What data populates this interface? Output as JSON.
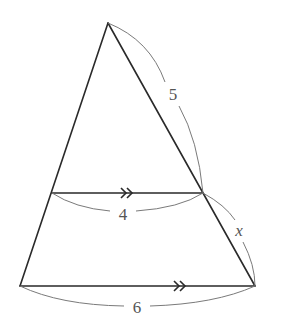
{
  "diagram": {
    "type": "similar-triangles-parallel-lines",
    "points": {
      "apex": [
        108,
        23
      ],
      "mid_left": [
        52,
        193
      ],
      "mid_right": [
        203,
        193
      ],
      "bottom_left": [
        20,
        286
      ],
      "bottom_right": [
        255,
        286
      ]
    },
    "labels": {
      "upper_right_side": "5",
      "middle_segment": "4",
      "lower_right_side": "x",
      "bottom_segment": "6"
    },
    "parallel_marker": "»",
    "colors": {
      "edge": "#2a2a2a",
      "dimension_arc": "#7a7a7a",
      "label": "#555555"
    }
  }
}
